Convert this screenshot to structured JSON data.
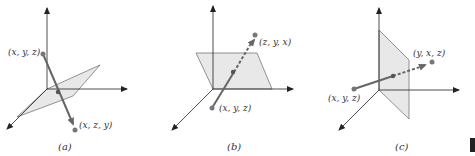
{
  "figure": {
    "panels": [
      {
        "caption": "(a)",
        "start_label": "(x, y, z)",
        "end_label": "(x, z, y)",
        "plane": "diagonal plane y = z"
      },
      {
        "caption": "(b)",
        "start_label": "(x, y, z)",
        "end_label": "(z, y, x)",
        "plane": "diagonal plane x = z"
      },
      {
        "caption": "(c)",
        "start_label": "(x, y, z)",
        "end_label": "(y, x, z)",
        "plane": "diagonal plane x = y"
      }
    ],
    "colors": {
      "axis": "#222222",
      "plane_fill": "#e6e6e6",
      "plane_stroke": "#777777",
      "vector": "#666666",
      "point": "#777777"
    }
  }
}
